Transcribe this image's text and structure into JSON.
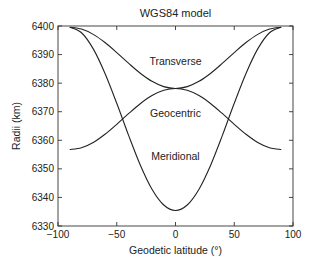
{
  "chart_data": {
    "type": "line",
    "title": "WGS84 model",
    "xlabel": "Geodetic latitude (°)",
    "ylabel": "Radii (km)",
    "xlim": [
      -100,
      100
    ],
    "ylim": [
      6330,
      6400
    ],
    "xticks": [
      -100,
      -50,
      0,
      50,
      100
    ],
    "yticks": [
      6330,
      6340,
      6350,
      6360,
      6370,
      6380,
      6390,
      6400
    ],
    "grid": false,
    "legend": "none (inline annotations)",
    "x": [
      -90,
      -80,
      -70,
      -60,
      -50,
      -40,
      -30,
      -20,
      -10,
      0,
      10,
      20,
      30,
      40,
      50,
      60,
      70,
      80,
      90
    ],
    "series": [
      {
        "name": "Transverse",
        "values": [
          6399.59,
          6398.94,
          6397.07,
          6394.21,
          6390.7,
          6386.98,
          6383.48,
          6380.64,
          6378.78,
          6378.14,
          6378.78,
          6380.64,
          6383.48,
          6386.98,
          6390.7,
          6394.21,
          6397.07,
          6398.94,
          6399.59
        ]
      },
      {
        "name": "Geocentric",
        "values": [
          6356.75,
          6357.4,
          6359.25,
          6362.1,
          6365.59,
          6369.3,
          6372.79,
          6375.64,
          6377.49,
          6378.14,
          6377.49,
          6375.64,
          6372.79,
          6369.3,
          6365.59,
          6362.1,
          6359.25,
          6357.4,
          6356.75
        ]
      },
      {
        "name": "Meridional",
        "values": [
          6399.59,
          6397.64,
          6391.99,
          6383.4,
          6372.95,
          6361.82,
          6351.38,
          6342.88,
          6337.36,
          6335.44,
          6337.36,
          6342.88,
          6351.38,
          6361.82,
          6372.95,
          6383.4,
          6391.99,
          6397.64,
          6399.59
        ]
      }
    ],
    "annotations": [
      {
        "text": "Transverse",
        "x": 0,
        "y": 6386.5
      },
      {
        "text": "Geocentric",
        "x": 0,
        "y": 6368
      },
      {
        "text": "Meridional",
        "x": 0,
        "y": 6353
      }
    ]
  }
}
